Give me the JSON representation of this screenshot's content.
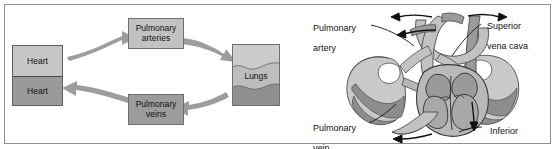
{
  "figure": {
    "border_color": "#8e8e8e",
    "background": "#ffffff"
  },
  "colors": {
    "light_gray": "#cfcfcf",
    "mid_gray": "#b3b3b3",
    "dark_gray": "#8f8f8f",
    "darker_gray": "#7a7a7a",
    "arrow_gray": "#9a9a9a",
    "outline": "#3a3a3a",
    "text": "#111111"
  },
  "cycle_diagram": {
    "name": "pulmonary-circulation-cycle",
    "boxes": [
      {
        "id": "heart-top",
        "label": "Heart",
        "fill": "#c6c6c6"
      },
      {
        "id": "heart-bottom",
        "label": "Heart",
        "fill": "#9a9a9a"
      },
      {
        "id": "pulmonary-arteries",
        "label": "Pulmonary\narteries",
        "label_line1": "Pulmonary",
        "label_line2": "arteries",
        "fill": "#c2c2c2"
      },
      {
        "id": "pulmonary-veins",
        "label": "Pulmonary\nveins",
        "label_line1": "Pulmonary",
        "label_line2": "veins",
        "fill": "#9c9c9c"
      },
      {
        "id": "lungs",
        "label": "Lungs",
        "fill_top": "#cbcbcb",
        "fill_mid": "#bdbdbd",
        "fill_bottom": "#8f8f8f"
      }
    ],
    "arrows": [
      {
        "id": "heart-to-arteries",
        "direction": "right-up"
      },
      {
        "id": "arteries-to-lungs",
        "direction": "right-down"
      },
      {
        "id": "lungs-to-veins",
        "direction": "left"
      },
      {
        "id": "veins-to-heart",
        "direction": "left-up"
      }
    ]
  },
  "anatomy_diagram": {
    "name": "heart-lungs-anatomy",
    "labels": [
      {
        "id": "pulmonary-artery",
        "line1": "Pulmonary",
        "line2": "artery"
      },
      {
        "id": "superior-vena-cava",
        "line1": "Superior",
        "line2": "vena cava"
      },
      {
        "id": "pulmonary-vein",
        "line1": "Pulmonary",
        "line2": "vein"
      },
      {
        "id": "inferior-vena-cava",
        "line1": "Inferior",
        "line2": "vena cava"
      }
    ],
    "flow_arrows": [
      {
        "id": "flow-arrow-top-left-outer",
        "direction": "left"
      },
      {
        "id": "flow-arrow-top-left-inner",
        "direction": "left"
      },
      {
        "id": "flow-arrow-top-right",
        "direction": "right"
      },
      {
        "id": "flow-arrow-inferior-down",
        "direction": "down"
      },
      {
        "id": "flow-arrow-inferior-left",
        "direction": "left"
      }
    ]
  }
}
